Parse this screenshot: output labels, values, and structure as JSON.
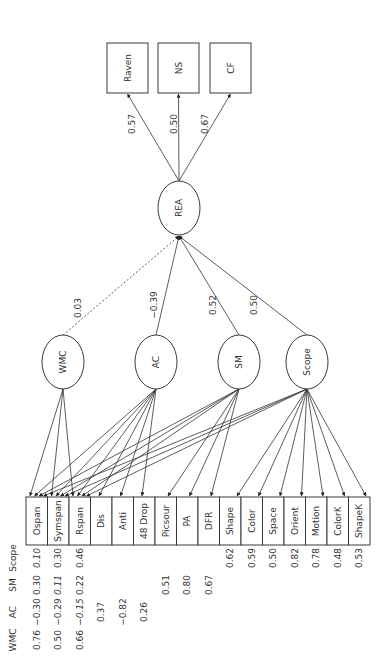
{
  "diagram": {
    "orientation": "rotated-90-ccw",
    "outcome_indicators": [
      {
        "label": "Raven",
        "loading": "0.57"
      },
      {
        "label": "NS",
        "loading": "0.50"
      },
      {
        "label": "CF",
        "loading": "0.67"
      }
    ],
    "outcome_factor": {
      "label": "REA"
    },
    "predictor_factors": [
      {
        "label": "WMC",
        "path": "0.03",
        "dashed": true
      },
      {
        "label": "AC",
        "path": "−0.39",
        "dashed": false
      },
      {
        "label": "SM",
        "path": "0.52",
        "dashed": false
      },
      {
        "label": "Scope",
        "path": "0.50",
        "dashed": false
      }
    ],
    "indicators": [
      "Ospan",
      "Symspan",
      "Rspan",
      "Dis",
      "Anti",
      "48 Drop",
      "Picsour",
      "PA",
      "DFR",
      "Shape",
      "Color",
      "Space",
      "Orient",
      "Motion",
      "ColorK",
      "ShapeK"
    ],
    "loadings_table": {
      "headers": [
        "WMC",
        "AC",
        "SM",
        "Scope"
      ],
      "rows": {
        "Ospan": {
          "WMC": "0.76",
          "AC": "−0.30",
          "SM": "0.30",
          "Scope": "0.10"
        },
        "Symspan": {
          "WMC": "0.50",
          "AC": "−0.29",
          "SM": "0.11",
          "Scope": "0.30"
        },
        "Rspan": {
          "WMC": "0.66",
          "AC": "−0.15",
          "SM": "0.22",
          "Scope": "0.46"
        },
        "Dis": {
          "AC": "0.37"
        },
        "Anti": {
          "AC": "−0.82"
        },
        "48 Drop": {
          "AC": "0.26"
        },
        "Picsour": {
          "SM": "0.51"
        },
        "PA": {
          "SM": "0.80"
        },
        "DFR": {
          "SM": "0.67"
        },
        "Shape": {
          "Scope": "0.62"
        },
        "Color": {
          "Scope": "0.59"
        },
        "Space": {
          "Scope": "0.50"
        },
        "Orient": {
          "Scope": "0.82"
        },
        "Motion": {
          "Scope": "0.78"
        },
        "ColorK": {
          "Scope": "0.48"
        },
        "ShapeK": {
          "Scope": "0.53"
        }
      },
      "italic": [
        "Ospan.Scope",
        "Symspan.SM",
        "Rspan.AC"
      ]
    }
  }
}
